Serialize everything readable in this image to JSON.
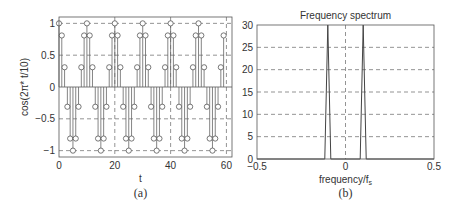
{
  "chart_data": [
    {
      "type": "stem",
      "panel_caption": "(a)",
      "title": "",
      "xlabel": "t",
      "ylabel": "cos(2π* t/10)",
      "xlim": [
        0,
        62
      ],
      "ylim": [
        -1.1,
        1.1
      ],
      "xticks": [
        0,
        20,
        40,
        60
      ],
      "xtick_labels": [
        "0",
        "20",
        "40",
        "60"
      ],
      "yticks": [
        -1,
        -0.5,
        0,
        0.5,
        1
      ],
      "ytick_labels": [
        "−1",
        "−0.5",
        "0",
        "0.5",
        "1"
      ],
      "grid": true,
      "x": [
        0,
        1,
        2,
        3,
        4,
        5,
        6,
        7,
        8,
        9,
        10,
        11,
        12,
        13,
        14,
        15,
        16,
        17,
        18,
        19,
        20,
        21,
        22,
        23,
        24,
        25,
        26,
        27,
        28,
        29,
        30,
        31,
        32,
        33,
        34,
        35,
        36,
        37,
        38,
        39,
        40,
        41,
        42,
        43,
        44,
        45,
        46,
        47,
        48,
        49,
        50,
        51,
        52,
        53,
        54,
        55,
        56,
        57,
        58,
        59
      ],
      "values": [
        1,
        0.81,
        0.31,
        -0.31,
        -0.81,
        -1,
        -0.81,
        -0.31,
        0.31,
        0.81,
        1,
        0.81,
        0.31,
        -0.31,
        -0.81,
        -1,
        -0.81,
        -0.31,
        0.31,
        0.81,
        1,
        0.81,
        0.31,
        -0.31,
        -0.81,
        -1,
        -0.81,
        -0.31,
        0.31,
        0.81,
        1,
        0.81,
        0.31,
        -0.31,
        -0.81,
        -1,
        -0.81,
        -0.31,
        0.31,
        0.81,
        1,
        0.81,
        0.31,
        -0.31,
        -0.81,
        -1,
        -0.81,
        -0.31,
        0.31,
        0.81,
        1,
        0.81,
        0.31,
        -0.31,
        -0.81,
        -1,
        -0.81,
        -0.31,
        0.31,
        0.81
      ]
    },
    {
      "type": "line",
      "panel_caption": "(b)",
      "title": "Frequency spectrum",
      "xlabel": "frequency/f",
      "xlabel_subscript": "s",
      "ylabel": "",
      "xlim": [
        -0.5,
        0.5
      ],
      "ylim": [
        0,
        30
      ],
      "xticks": [
        -0.5,
        0,
        0.5
      ],
      "xtick_labels": [
        "−0.5",
        "0",
        "0.5"
      ],
      "yticks": [
        0,
        5,
        10,
        15,
        20,
        25,
        30
      ],
      "ytick_labels": [
        "0",
        "5",
        "10",
        "15",
        "20",
        "25",
        "30"
      ],
      "grid": true,
      "x": [
        -0.5,
        -0.117,
        -0.1,
        -0.083,
        0.083,
        0.1,
        0.117,
        0.5
      ],
      "values": [
        0,
        0,
        30,
        0,
        0,
        30,
        0,
        0
      ],
      "peaks": [
        {
          "frequency": -0.1,
          "magnitude": 30
        },
        {
          "frequency": 0.1,
          "magnitude": 30
        }
      ]
    }
  ]
}
